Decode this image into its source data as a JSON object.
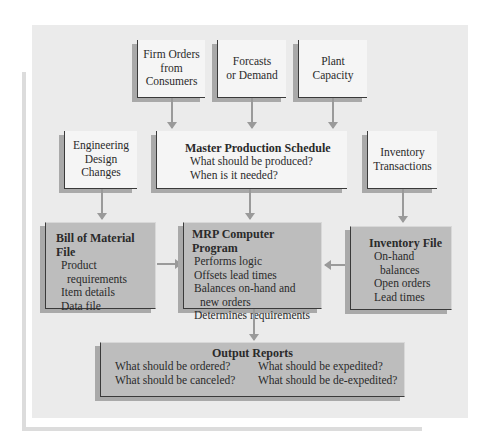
{
  "diagram": {
    "inputs_top": [
      {
        "id": "firm-orders",
        "lines": [
          "Firm Orders",
          "from",
          "Consumers"
        ]
      },
      {
        "id": "forecasts",
        "lines": [
          "Forcasts",
          "or Demand"
        ]
      },
      {
        "id": "plant-capacity",
        "lines": [
          "Plant",
          "Capacity"
        ]
      }
    ],
    "engineering": {
      "lines": [
        "Engineering",
        "Design",
        "Changes"
      ]
    },
    "master_schedule": {
      "title": "Master Production Schedule",
      "items": [
        "What should be produced?",
        "When is it needed?"
      ]
    },
    "inventory_transactions": {
      "lines": [
        "Inventory",
        "Transactions"
      ]
    },
    "bom": {
      "title": "Bill of Material File",
      "items": [
        "Product",
        "requirements",
        "Item details",
        "Data file"
      ]
    },
    "mrp": {
      "title": "MRP Computer Program",
      "items": [
        "Performs logic",
        "Offsets lead times",
        "Balances on-hand and",
        "new orders",
        "Determines requirements"
      ]
    },
    "inventory_file": {
      "title": "Inventory File",
      "items": [
        "On-hand",
        "balances",
        "Open orders",
        "Lead times"
      ]
    },
    "output_reports": {
      "title": "Output Reports",
      "items": [
        "What should be ordered?",
        "What  should be expedited?",
        "What should be canceled?",
        "What should be de-expedited?"
      ]
    },
    "colors": {
      "panel": "#ebebeb",
      "light_box": "#f5f5f5",
      "dark_box": "#bdbdbd",
      "shadow": "#a9a9a9",
      "arrow": "#9a9a9a",
      "border": "#3a3a3a"
    }
  }
}
